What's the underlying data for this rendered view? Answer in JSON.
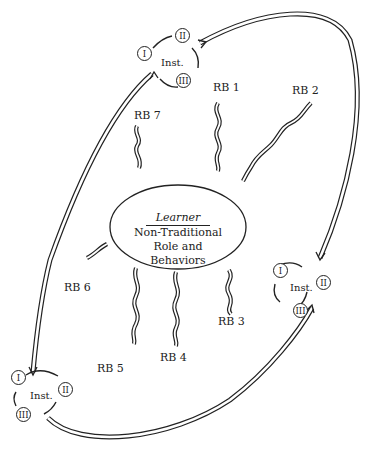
{
  "learner": {
    "title": "Learner",
    "line1": "Non-Traditional",
    "line2": "Role and",
    "line3": "Behaviors"
  },
  "role_behaviors": [
    {
      "label": "RB 1"
    },
    {
      "label": "RB 2"
    },
    {
      "label": "RB 3"
    },
    {
      "label": "RB 4"
    },
    {
      "label": "RB 5"
    },
    {
      "label": "RB 6"
    },
    {
      "label": "RB 7"
    }
  ],
  "institutions": [
    {
      "label": "Inst.",
      "nodes": [
        "I",
        "II",
        "III"
      ],
      "position": "top"
    },
    {
      "label": "Inst.",
      "nodes": [
        "I",
        "II",
        "III"
      ],
      "position": "right"
    },
    {
      "label": "Inst.",
      "nodes": [
        "I",
        "II",
        "III"
      ],
      "position": "bottom-left"
    }
  ],
  "colors": {
    "stroke": "#222222",
    "background": "#ffffff"
  }
}
